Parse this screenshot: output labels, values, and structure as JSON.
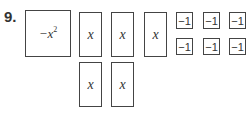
{
  "problem": {
    "number": "9.",
    "x_squared_tile": {
      "label_prefix": "−x",
      "exponent": "2"
    },
    "x_tiles": [
      {
        "label": "x"
      },
      {
        "label": "x"
      },
      {
        "label": "x"
      },
      {
        "label": "x"
      },
      {
        "label": "x"
      }
    ],
    "unit_tiles": [
      {
        "label": "−1"
      },
      {
        "label": "−1"
      },
      {
        "label": "−1"
      },
      {
        "label": "−1"
      },
      {
        "label": "−1"
      },
      {
        "label": "−1"
      }
    ]
  }
}
